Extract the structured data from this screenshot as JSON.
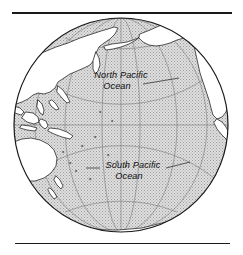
{
  "figure": {
    "kind": "orthographic-globe-map",
    "projection": "orthographic",
    "center_lon": -160,
    "center_lat": 0,
    "rules": {
      "top": "horizontal-rule-thick",
      "bottom": "horizontal-rule-thin"
    }
  },
  "labels": {
    "north_pacific": {
      "line1": "North Pacific",
      "line2": "Ocean"
    },
    "south_pacific": {
      "line1": "South Pacific",
      "line2": "Ocean"
    }
  },
  "graticule": {
    "interval_degrees": 30,
    "parallels": [
      "60N",
      "30N",
      "0",
      "30S",
      "60S"
    ],
    "meridians": [
      "150E",
      "180",
      "150W",
      "120W",
      "90W"
    ]
  },
  "colors": {
    "ocean_fill": "#d9d9d9",
    "ocean_stipple": "#9a9a9a",
    "land_fill": "#ffffff",
    "coastline": "#1a1a1a",
    "graticule": "#6e6e6e",
    "outline": "#1a1a1a",
    "rule": "#1a1a1a",
    "label_text": "#111111",
    "background": "#ffffff"
  },
  "geography": {
    "oceans": [
      "North Pacific Ocean",
      "South Pacific Ocean"
    ],
    "landmasses_visible": [
      "Asia",
      "Australia",
      "North America",
      "South America",
      "Antarctica",
      "Indonesia",
      "Japan",
      "New Zealand",
      "Pacific Islands"
    ]
  }
}
